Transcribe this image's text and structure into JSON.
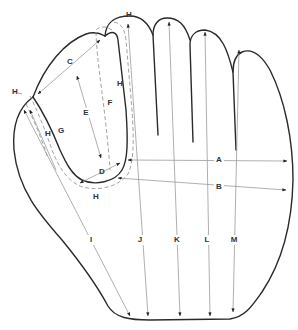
{
  "diagram": {
    "colors": {
      "outline": "#2a2a2a",
      "measure_line": "#9a9a9a",
      "dashed_guide": "#8a8a8a",
      "label": "#333333"
    },
    "labels": {
      "A": "A",
      "B": "B",
      "C": "C",
      "D": "D",
      "E": "E",
      "F": "F",
      "G": "G",
      "H_top": "H",
      "H_left": "H",
      "H_thumb_inner": "H",
      "H_index": "H",
      "H_bottom": "H",
      "I": "I",
      "J": "J",
      "K": "K",
      "L": "L",
      "M": "M"
    }
  }
}
